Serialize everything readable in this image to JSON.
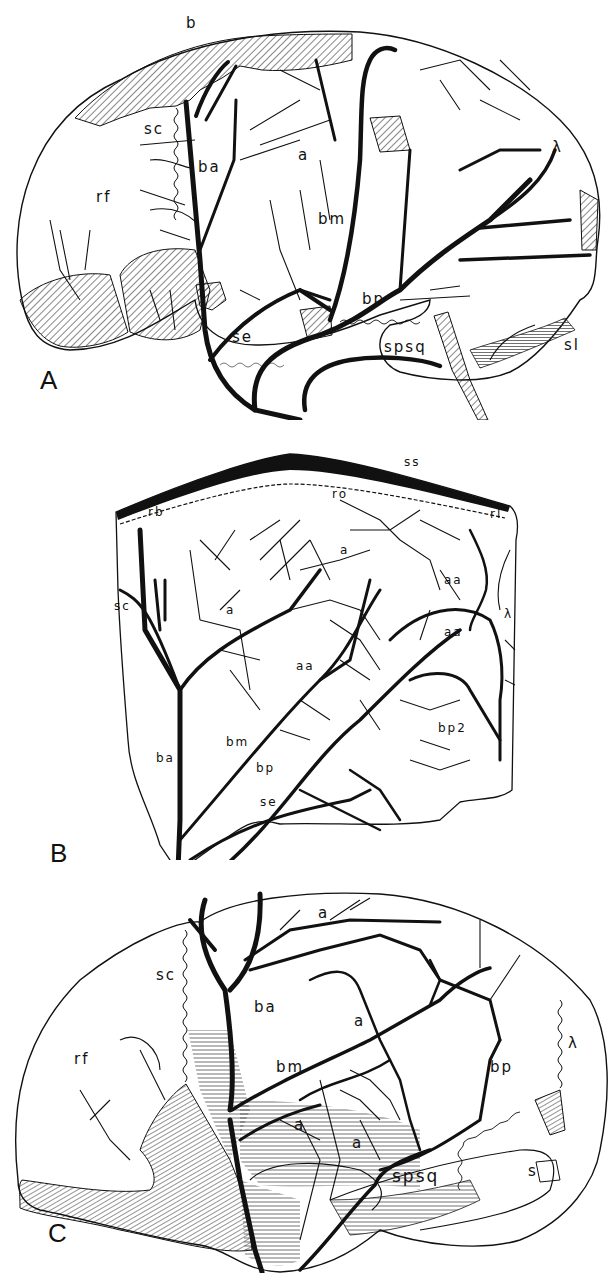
{
  "figure": {
    "panels": [
      {
        "id": "A",
        "panel_label": "A",
        "labels": {
          "b": "b",
          "sc": "sc",
          "ba": "ba",
          "a": "a",
          "lambda": "λ",
          "rf": "rf",
          "bm": "bm",
          "bp": "bp",
          "se": "se",
          "spsq": "spsq",
          "sl": "sl"
        }
      },
      {
        "id": "B",
        "panel_label": "B",
        "labels": {
          "ss": "ss",
          "ro": "ro",
          "rb": "rb",
          "rl": "rl",
          "a1": "a",
          "sc": "sc",
          "a2": "a",
          "aa1": "aa",
          "lambda": "λ",
          "aa2": "aa",
          "aa3": "aa",
          "bp2": "bp2",
          "bm": "bm",
          "ba": "ba",
          "bp": "bp",
          "se": "se"
        }
      },
      {
        "id": "C",
        "panel_label": "C",
        "labels": {
          "a1": "a",
          "sc": "sc",
          "ba": "ba",
          "a2": "a",
          "lambda": "λ",
          "rf": "rf",
          "bm": "bm",
          "bp": "bp",
          "a3": "a",
          "a4": "a",
          "spsq": "spsq",
          "s": "s"
        }
      }
    ]
  }
}
